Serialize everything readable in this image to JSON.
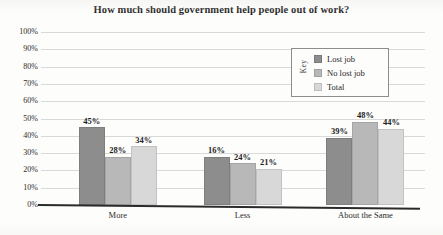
{
  "chart_data": {
    "type": "bar",
    "title": "How much should government help people out of work?",
    "xlabel": "",
    "ylabel": "",
    "categories": [
      "More",
      "Less",
      "About the Same"
    ],
    "series": [
      {
        "name": "Lost job",
        "values": [
          45,
          28,
          39
        ],
        "color": "#8d8d8d"
      },
      {
        "name": "No lost job",
        "values": [
          28,
          24,
          48
        ],
        "color": "#b8b8b8"
      },
      {
        "name": "Total",
        "values": [
          34,
          21,
          44
        ],
        "color": "#d8d8d8"
      }
    ],
    "value_labels": [
      [
        "45%",
        "28%",
        "34%"
      ],
      [
        "16%",
        "24%",
        "21%"
      ],
      [
        "39%",
        "48%",
        "44%"
      ]
    ],
    "ylim": [
      0,
      100
    ],
    "yticks": [
      "0%",
      "10%",
      "20%",
      "30%",
      "40%",
      "50%",
      "60%",
      "70%",
      "80%",
      "90%",
      "100%"
    ],
    "ytick_values": [
      0,
      10,
      20,
      30,
      40,
      50,
      60,
      70,
      80,
      90,
      100
    ],
    "grid": true,
    "legend_position": "inside-upper-right",
    "legend_title": "Key",
    "value_unit": "%"
  },
  "legend": {
    "title": "Key",
    "entries": [
      {
        "label": "Lost job",
        "color": "#8d8d8d"
      },
      {
        "label": "No lost job",
        "color": "#b8b8b8"
      },
      {
        "label": "Total",
        "color": "#d8d8d8"
      }
    ]
  },
  "axis": {
    "y_ticks": [
      "100%",
      "90%",
      "80%",
      "70%",
      "60%",
      "50%",
      "40%",
      "30%",
      "20%",
      "10%",
      "0%"
    ],
    "x_categories": [
      "More",
      "Less",
      "About the Same"
    ]
  },
  "bar_values": {
    "more": {
      "lost_job": "45%",
      "no_lost_job": "28%",
      "total": "34%"
    },
    "less": {
      "lost_job": "16%",
      "no_lost_job": "24%",
      "total": "21%"
    },
    "about_the_same": {
      "lost_job": "39%",
      "no_lost_job": "48%",
      "total": "44%"
    }
  }
}
